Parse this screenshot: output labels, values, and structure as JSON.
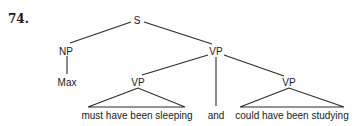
{
  "example_number": "74.",
  "tree": {
    "root": "S",
    "subject": {
      "label": "NP",
      "leaf": "Max"
    },
    "predicate": {
      "label": "VP",
      "conjunct_1": {
        "label": "VP",
        "leaf": "must have been sleeping"
      },
      "conjunction": "and",
      "conjunct_2": {
        "label": "VP",
        "leaf": "could have been studying"
      }
    }
  }
}
